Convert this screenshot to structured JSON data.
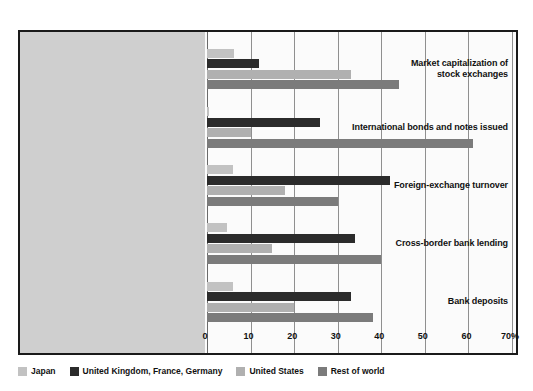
{
  "chart_data": {
    "type": "bar",
    "orientation": "horizontal",
    "title": "",
    "subtitle": "",
    "xlabel": "",
    "ylabel": "",
    "xlim": [
      0,
      70
    ],
    "x_unit": "%",
    "grid": true,
    "legend_position": "bottom-left",
    "xticks": [
      {
        "value": 0,
        "label": "0"
      },
      {
        "value": 10,
        "label": "10"
      },
      {
        "value": 20,
        "label": "20"
      },
      {
        "value": 30,
        "label": "30"
      },
      {
        "value": 40,
        "label": "40"
      },
      {
        "value": 50,
        "label": "50"
      },
      {
        "value": 60,
        "label": "60"
      },
      {
        "value": 70,
        "label": "70%"
      }
    ],
    "categories": [
      "Market capitalization of\nstock exchanges",
      "International bonds and notes issued",
      "Foreign-exchange turnover",
      "Cross-border bank lending",
      "Bank deposits"
    ],
    "series": [
      {
        "name": "Japan",
        "color": "#c2c2c2",
        "key": "japan",
        "values": [
          6.3,
          0.5,
          6.0,
          4.5,
          6.0
        ]
      },
      {
        "name": "United Kingdom, France, Germany",
        "color": "#2b2b2b",
        "key": "ukfrde",
        "values": [
          12.0,
          26.0,
          42.0,
          34.0,
          33.0
        ]
      },
      {
        "name": "United States",
        "color": "#b0b0b0",
        "key": "us",
        "values": [
          33.0,
          10.0,
          18.0,
          15.0,
          20.0
        ]
      },
      {
        "name": "Rest of world",
        "color": "#7b7b7b",
        "key": "row",
        "values": [
          44.0,
          61.0,
          30.0,
          40.0,
          38.0
        ]
      }
    ]
  },
  "legend": {
    "items": [
      {
        "label": "Japan"
      },
      {
        "label": "United Kingdom, France, Germany"
      },
      {
        "label": "United States"
      },
      {
        "label": "Rest of world"
      }
    ]
  },
  "axis": {
    "tick_0": "0",
    "tick_10": "10",
    "tick_20": "20",
    "tick_30": "30",
    "tick_40": "40",
    "tick_50": "50",
    "tick_60": "60",
    "tick_70": "70%"
  },
  "categories_text": {
    "cat0": "Market capitalization of\nstock exchanges",
    "cat1": "International bonds and notes issued",
    "cat2": "Foreign-exchange turnover",
    "cat3": "Cross-border bank lending",
    "cat4": "Bank deposits"
  },
  "colors": {
    "japan": "#c2c2c2",
    "uk_fr_de": "#2b2b2b",
    "united_states": "#b0b0b0",
    "rest_of_world": "#7b7b7b",
    "label_band": "#cfcfcf",
    "frame": "#1a1a1a",
    "gridline": "#8f8f8f"
  }
}
